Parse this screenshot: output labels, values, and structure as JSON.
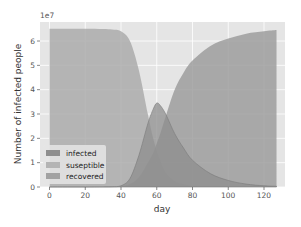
{
  "chart_data": {
    "type": "area",
    "title": "",
    "xlabel": "day",
    "ylabel": "Number of infected people",
    "y_offset_label": "1e7",
    "xlim": [
      -5,
      133
    ],
    "ylim": [
      0,
      6.8
    ],
    "y_scale_multiplier": 10000000,
    "grid": true,
    "style": "ggplot",
    "legend_position": "lower left",
    "x_ticks": [
      0,
      20,
      40,
      60,
      80,
      100,
      120
    ],
    "y_ticks": [
      0,
      1,
      2,
      3,
      4,
      5,
      6
    ],
    "x": [
      0,
      10,
      20,
      30,
      35,
      40,
      45,
      50,
      55,
      58,
      60,
      62,
      65,
      70,
      75,
      80,
      90,
      100,
      110,
      120,
      127
    ],
    "series": [
      {
        "name": "infected",
        "color": "#8e8e8e",
        "values": [
          0,
          0,
          0,
          0.005,
          0.01,
          0.05,
          0.35,
          1.3,
          2.6,
          3.2,
          3.45,
          3.35,
          3.0,
          2.2,
          1.6,
          1.1,
          0.55,
          0.27,
          0.12,
          0.05,
          0.03
        ]
      },
      {
        "name": "suseptible",
        "color": "#ababab",
        "values": [
          6.5,
          6.5,
          6.5,
          6.49,
          6.47,
          6.4,
          6.0,
          4.8,
          3.0,
          2.0,
          1.5,
          1.1,
          0.6,
          0.25,
          0.12,
          0.05,
          0.02,
          0.01,
          0.0,
          0.0,
          0.0
        ]
      },
      {
        "name": "recovered",
        "color": "#9d9d9d",
        "values": [
          0,
          0,
          0,
          0,
          0,
          0.02,
          0.12,
          0.4,
          1.0,
          1.4,
          1.8,
          2.2,
          2.9,
          4.0,
          4.7,
          5.2,
          5.8,
          6.1,
          6.3,
          6.4,
          6.45
        ]
      }
    ]
  },
  "legend": {
    "items": [
      {
        "label": "infected",
        "color": "#8e8e8e"
      },
      {
        "label": "suseptible",
        "color": "#b4b4b4"
      },
      {
        "label": "recovered",
        "color": "#a2a2a2"
      }
    ]
  },
  "axes": {
    "xlabel": "day",
    "ylabel": "Number of infected people",
    "offset": "1e7",
    "x_tick_labels": [
      "0",
      "20",
      "40",
      "60",
      "80",
      "100",
      "120"
    ],
    "y_tick_labels": [
      "0",
      "1",
      "2",
      "3",
      "4",
      "5",
      "6"
    ]
  },
  "colors": {
    "plot_background": "#e5e5e5",
    "grid": "#ffffff",
    "infected_line": "#7a7a7a"
  }
}
